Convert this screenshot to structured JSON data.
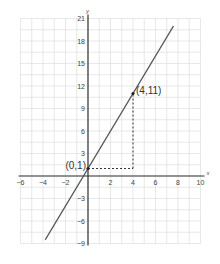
{
  "chart_data": {
    "type": "line",
    "title": "",
    "xlabel": "x",
    "ylabel": "y",
    "xlim": [
      -6,
      10
    ],
    "ylim": [
      -9,
      21
    ],
    "grid": true,
    "x_ticks": [
      -6,
      -4,
      -2,
      2,
      4,
      6,
      8,
      10
    ],
    "y_ticks": [
      21,
      18,
      15,
      12,
      9,
      6,
      3,
      -3,
      -6,
      -9
    ],
    "x_tick_labels": [
      "−6",
      "−4",
      "−2",
      "2",
      "4",
      "6",
      "8",
      "10"
    ],
    "y_tick_labels": [
      "21",
      "18",
      "15",
      "12",
      "9",
      "6",
      "3",
      "−3",
      "−6",
      "−9"
    ],
    "series": [
      {
        "name": "y = 2.5x + 1",
        "x": [
          -3.8,
          7.6
        ],
        "y": [
          -8.5,
          20
        ]
      }
    ],
    "points": [
      {
        "x": 0,
        "y": 1,
        "label": "(0,1)"
      },
      {
        "x": 4,
        "y": 11,
        "label": "(4,11)"
      }
    ],
    "annotations": [
      {
        "type": "dashed-guide",
        "from": [
          0,
          1
        ],
        "to": [
          4,
          1
        ]
      },
      {
        "type": "dashed-guide",
        "from": [
          4,
          1
        ],
        "to": [
          4,
          11
        ]
      }
    ],
    "colors": {
      "line": "#555555",
      "grid": "#d8d8d8",
      "axis": "#333333"
    }
  }
}
